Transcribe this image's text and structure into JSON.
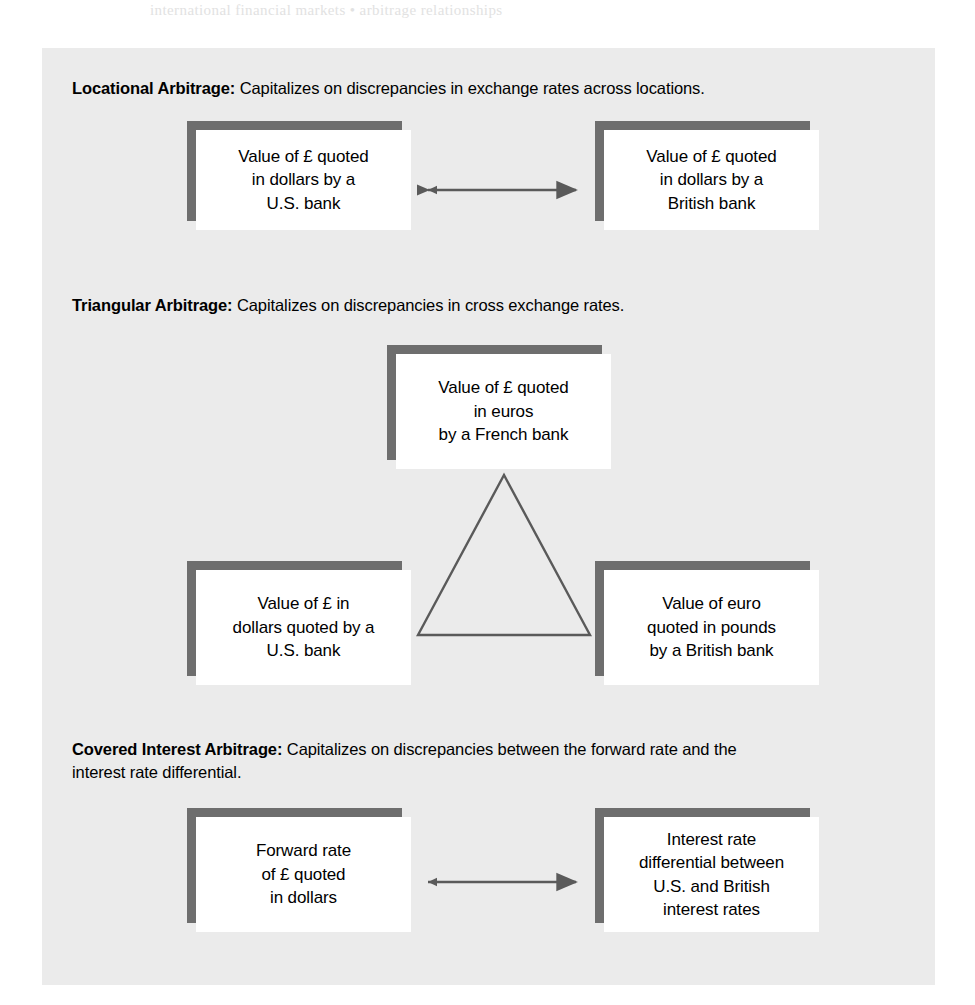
{
  "page": {
    "bleed_text": "international financial markets  •  arbitrage relationships",
    "panel_bg": "#ebebeb",
    "box_shadow_color": "#6e6e6e",
    "line_color": "#5a5a5a"
  },
  "sections": [
    {
      "id": "locational",
      "term": "Locational Arbitrage:",
      "description": " Capitalizes on discrepancies in exchange rates across locations.",
      "boxes": [
        {
          "id": "loc-left",
          "text": "Value of £ quoted\nin dollars by a\nU.S. bank"
        },
        {
          "id": "loc-right",
          "text": "Value of £ quoted\nin dollars by a\nBritish bank"
        }
      ],
      "connector": "double-headed-arrow"
    },
    {
      "id": "triangular",
      "term": "Triangular Arbitrage:",
      "description": " Capitalizes on discrepancies in cross exchange rates.",
      "boxes": [
        {
          "id": "tri-top",
          "text": "Value of £ quoted\nin euros\nby a French bank"
        },
        {
          "id": "tri-left",
          "text": "Value of £ in\ndollars quoted by a\nU.S. bank"
        },
        {
          "id": "tri-right",
          "text": "Value of euro\nquoted in pounds\nby a British bank"
        }
      ],
      "connector": "triangle"
    },
    {
      "id": "covered-interest",
      "term": "Covered Interest Arbitrage:",
      "description": " Capitalizes on discrepancies between the forward rate and the",
      "description_line2": "interest rate differential.",
      "boxes": [
        {
          "id": "cov-left",
          "text": "Forward rate\nof £ quoted\nin dollars"
        },
        {
          "id": "cov-right",
          "text": "Interest rate\ndifferential between\nU.S. and British\ninterest rates"
        }
      ],
      "connector": "double-headed-arrow"
    }
  ]
}
